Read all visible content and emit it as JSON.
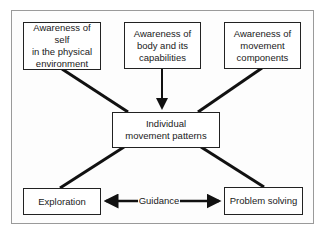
{
  "diagram": {
    "top_boxes": [
      {
        "lines": [
          "Awareness of self",
          "in the physical",
          "environment"
        ]
      },
      {
        "lines": [
          "Awareness of",
          "body and its",
          "capabilities"
        ]
      },
      {
        "lines": [
          "Awareness of",
          "movement",
          "components"
        ]
      }
    ],
    "center_box": {
      "lines": [
        "Individual",
        "movement patterns"
      ]
    },
    "bottom_left": {
      "label": "Exploration"
    },
    "bottom_right": {
      "label": "Problem solving"
    },
    "connector_label": "Guidance",
    "edges": [
      {
        "from": "Awareness of self in the physical environment",
        "to": "Individual movement patterns",
        "arrow": false
      },
      {
        "from": "Awareness of body and its capabilities",
        "to": "Individual movement patterns",
        "arrow": true
      },
      {
        "from": "Awareness of movement components",
        "to": "Individual movement patterns",
        "arrow": false
      },
      {
        "from": "Individual movement patterns",
        "to": "Exploration",
        "arrow": false
      },
      {
        "from": "Individual movement patterns",
        "to": "Problem solving",
        "arrow": false
      },
      {
        "from": "Guidance",
        "to": [
          "Exploration",
          "Problem solving"
        ],
        "arrow": "both"
      }
    ]
  }
}
